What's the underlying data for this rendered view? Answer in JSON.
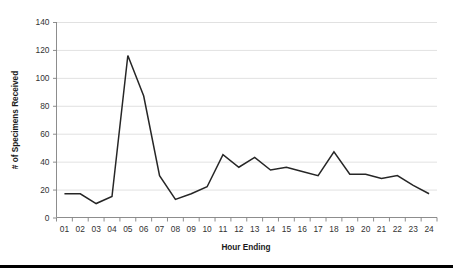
{
  "chart_data": {
    "type": "line",
    "title": "",
    "xlabel": "Hour Ending",
    "ylabel": "# of Specimens Received",
    "categories": [
      "01",
      "02",
      "03",
      "04",
      "05",
      "06",
      "07",
      "08",
      "09",
      "10",
      "11",
      "12",
      "13",
      "14",
      "15",
      "16",
      "17",
      "18",
      "19",
      "20",
      "21",
      "22",
      "23",
      "24"
    ],
    "values": [
      17,
      17,
      10,
      15,
      116,
      87,
      30,
      13,
      17,
      22,
      45,
      36,
      43,
      34,
      36,
      33,
      30,
      47,
      31,
      31,
      28,
      30,
      23,
      17
    ],
    "series": [
      {
        "name": "Specimens Received",
        "values": [
          17,
          17,
          10,
          15,
          116,
          87,
          30,
          13,
          17,
          22,
          45,
          36,
          43,
          34,
          36,
          33,
          30,
          47,
          31,
          31,
          28,
          30,
          23,
          17
        ],
        "color": "#262626"
      }
    ],
    "ylim": [
      0,
      140
    ],
    "yticks": [
      0,
      20,
      40,
      60,
      80,
      100,
      120,
      140
    ],
    "ytick_labels": [
      "0",
      "20",
      "40",
      "60",
      "80",
      "100",
      "120",
      "140"
    ],
    "xtick_labels": [
      "01",
      "02",
      "03",
      "04",
      "05",
      "06",
      "07",
      "08",
      "09",
      "10",
      "11",
      "12",
      "13",
      "14",
      "15",
      "16",
      "17",
      "18",
      "19",
      "20",
      "21",
      "22",
      "23",
      "24"
    ],
    "grid": "horizontal",
    "legend": "none",
    "annotations": []
  },
  "colors": {
    "line": "#262626",
    "gridline": "#d9d9d9",
    "axis": "#808080",
    "text": "#1a1a1a",
    "tick_text": "#333333",
    "background": "#ffffff",
    "bottom_rule": "#000000"
  }
}
